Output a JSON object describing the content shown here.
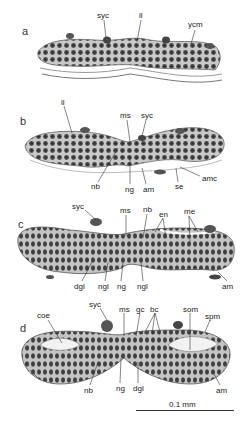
{
  "figure": {
    "panels": [
      {
        "letter": "a",
        "labels": [
          {
            "text": "syc",
            "x": 97,
            "y": 12
          },
          {
            "text": "il",
            "x": 138,
            "y": 12
          },
          {
            "text": "ycm",
            "x": 188,
            "y": 21
          }
        ]
      },
      {
        "letter": "b",
        "labels": [
          {
            "text": "il",
            "x": 61,
            "y": 99
          },
          {
            "text": "ms",
            "x": 121,
            "y": 112
          },
          {
            "text": "syc",
            "x": 141,
            "y": 112
          },
          {
            "text": "amc",
            "x": 200,
            "y": 175
          },
          {
            "text": "nb",
            "x": 91,
            "y": 183
          },
          {
            "text": "ng",
            "x": 126,
            "y": 186
          },
          {
            "text": "am",
            "x": 144,
            "y": 186
          },
          {
            "text": "se",
            "x": 176,
            "y": 183
          }
        ]
      },
      {
        "letter": "c",
        "labels": [
          {
            "text": "syc",
            "x": 72,
            "y": 203
          },
          {
            "text": "ms",
            "x": 121,
            "y": 207
          },
          {
            "text": "nb",
            "x": 143,
            "y": 206
          },
          {
            "text": "en",
            "x": 160,
            "y": 211
          },
          {
            "text": "me",
            "x": 184,
            "y": 208
          },
          {
            "text": "dgl",
            "x": 75,
            "y": 283
          },
          {
            "text": "ngl",
            "x": 99,
            "y": 283
          },
          {
            "text": "ng",
            "x": 117,
            "y": 283
          },
          {
            "text": "ngl",
            "x": 137,
            "y": 283
          },
          {
            "text": "am",
            "x": 222,
            "y": 283
          }
        ]
      },
      {
        "letter": "d",
        "labels": [
          {
            "text": "syc",
            "x": 89,
            "y": 301
          },
          {
            "text": "coe",
            "x": 37,
            "y": 312
          },
          {
            "text": "ms",
            "x": 119,
            "y": 306
          },
          {
            "text": "gc",
            "x": 136,
            "y": 306
          },
          {
            "text": "bc",
            "x": 150,
            "y": 306
          },
          {
            "text": "som",
            "x": 183,
            "y": 306
          },
          {
            "text": "spm",
            "x": 205,
            "y": 313
          },
          {
            "text": "nb",
            "x": 84,
            "y": 387
          },
          {
            "text": "ng",
            "x": 116,
            "y": 385
          },
          {
            "text": "dgl",
            "x": 134,
            "y": 385
          },
          {
            "text": "am",
            "x": 216,
            "y": 387
          }
        ]
      }
    ],
    "scale_bar": {
      "label": "0.1 mm"
    }
  }
}
